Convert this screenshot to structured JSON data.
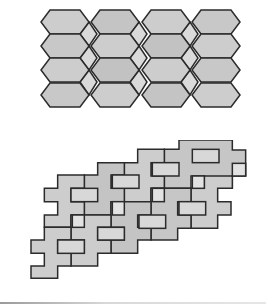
{
  "figure": {
    "type": "tessellation-illustration",
    "colors": {
      "stroke": "#2b2b2b",
      "fill_dark": "#c4c4c4",
      "fill_mid": "#cdcdcd",
      "fill_light": "#dadada",
      "background": "#ffffff"
    },
    "top_pattern": {
      "description": "Elongated hexagons with small rhombi tessellation",
      "rows": 4,
      "columns": 4
    },
    "bottom_pattern": {
      "description": "Staggered cross-shaped (polyomino) tiles with inset rectangles tessellation"
    }
  }
}
